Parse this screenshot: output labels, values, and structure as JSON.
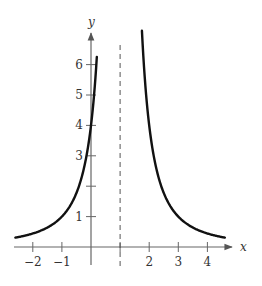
{
  "chart_data": {
    "type": "line",
    "title": "",
    "function": "y = 4/(x-1)^2",
    "xlabel": "x",
    "ylabel": "y",
    "xlim": [
      -2.6,
      4.8
    ],
    "ylim": [
      0,
      6.8
    ],
    "x_ticks": [
      -2,
      -1,
      1,
      2,
      3,
      4
    ],
    "x_tick_labels": [
      "−2",
      "−1",
      "",
      "2",
      "3",
      "4"
    ],
    "y_ticks": [
      1,
      2,
      3,
      4,
      5,
      6
    ],
    "y_tick_labels": [
      "1",
      "",
      "3",
      "4",
      "5",
      "6"
    ],
    "asymptotes": [
      {
        "type": "vertical",
        "x": 1,
        "style": "dashed"
      }
    ],
    "series": [
      {
        "name": "left branch",
        "x": [
          -2.6,
          -2,
          -1.5,
          -1,
          -0.5,
          0,
          0.1,
          0.2
        ],
        "y": [
          0.31,
          0.44,
          0.64,
          1.0,
          1.78,
          4.0,
          4.94,
          6.25
        ]
      },
      {
        "name": "right branch",
        "x": [
          1.75,
          2,
          2.5,
          3,
          3.5,
          4,
          4.5,
          4.6
        ],
        "y": [
          7.1,
          4.0,
          1.78,
          1.0,
          0.64,
          0.44,
          0.33,
          0.31
        ]
      }
    ],
    "grid": false,
    "legend": "none"
  }
}
